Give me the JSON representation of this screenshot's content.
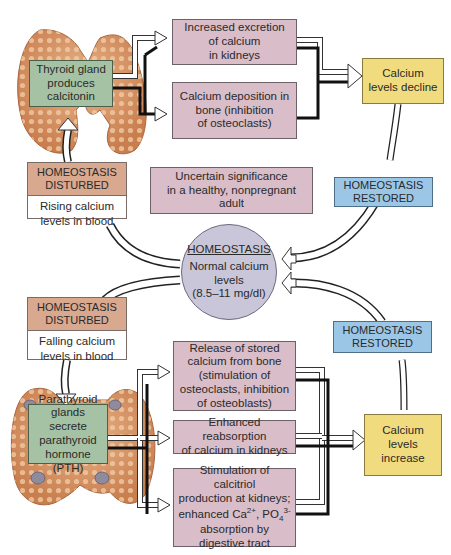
{
  "top_loop": {
    "gland": {
      "label": "Thyroid gland\nproduces\ncalcitonin",
      "organ": "thyroid gland"
    },
    "effects": [
      "Increased excretion\nof calcium\nin kidneys",
      "Calcium deposition in\nbone (inhibition\nof osteoclasts)"
    ],
    "result": "Calcium\nlevels decline",
    "disturbed": {
      "header": "HOMEOSTASIS\nDISTURBED",
      "text": "Rising calcium\nlevels in blood"
    },
    "restored": "HOMEOSTASIS\nRESTORED"
  },
  "note": "Uncertain significance\nin a healthy, nonpregnant adult",
  "center": {
    "title": "HOMEOSTASIS",
    "text": "Normal calcium\nlevels\n(8.5–11 mg/dl)"
  },
  "bottom_loop": {
    "disturbed": {
      "header": "HOMEOSTASIS\nDISTURBED",
      "text": "Falling calcium\nlevels in blood"
    },
    "gland": {
      "label": "Parathyroid\nglands secrete\nparathyroid\nhormone (PTH)",
      "organ": "parathyroid glands"
    },
    "effects": [
      "Release of stored\ncalcium from bone\n(stimulation of\nosteoclasts, inhibition\nof osteoblasts)",
      "Enhanced reabsorption\nof calcium in kidneys",
      "Stimulation of calcitriol\nproduction at kidneys;\nenhanced Ca2+, PO43-\nabsorption by\ndigestive tract"
    ],
    "effect3_parts": {
      "line1": "Stimulation of calcitriol",
      "line2": "production at kidneys;",
      "line3_pre": "enhanced Ca",
      "ca_sup": "2+",
      "mid": ", PO",
      "po_sub": "4",
      "po_sup": "3-",
      "line4": "absorption by",
      "line5": "digestive tract"
    },
    "result": "Calcium\nlevels\nincrease",
    "restored": "HOMEOSTASIS\nRESTORED"
  },
  "colors": {
    "effect_box": "#d9bdc9",
    "gland_box": "#a6c2a4",
    "result_box": "#f0dc7e",
    "restored_box": "#9cc6e6",
    "disturbed_header": "#d8a88f",
    "center_circle": "#c9c6d9",
    "gland_tissue": "#d9956a"
  }
}
